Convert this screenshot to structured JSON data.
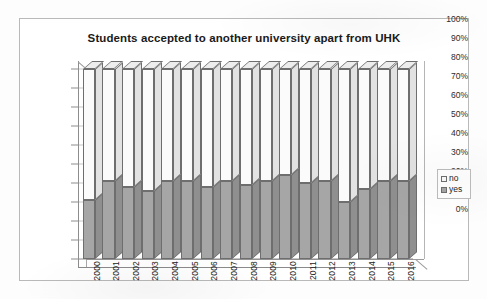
{
  "chart": {
    "title": "Students accepted to another university apart from UHK",
    "legend": {
      "items": [
        {
          "label": "no",
          "color": "#fbfbfb"
        },
        {
          "label": "yes",
          "color": "#a6a6a6"
        }
      ]
    }
  },
  "chart_data": {
    "type": "bar",
    "stacked": true,
    "normalized_percent": true,
    "title": "Students accepted to another university apart from UHK",
    "xlabel": "",
    "ylabel": "",
    "ylim": [
      0,
      100
    ],
    "yticks": [
      "0%",
      "10%",
      "20%",
      "30%",
      "40%",
      "50%",
      "60%",
      "70%",
      "80%",
      "90%",
      "100%"
    ],
    "ytick_values": [
      0,
      10,
      20,
      30,
      40,
      50,
      60,
      70,
      80,
      90,
      100
    ],
    "grid": true,
    "legend_position": "right",
    "categories": [
      "2000",
      "2001",
      "2002",
      "2003",
      "2004",
      "2005",
      "2006",
      "2007",
      "2008",
      "2009",
      "2010",
      "2011",
      "2012",
      "2013",
      "2014",
      "2015",
      "2016"
    ],
    "series": [
      {
        "name": "yes",
        "color": "#a6a6a6",
        "values": [
          31,
          41,
          38,
          36,
          41,
          41,
          38,
          41,
          39,
          41,
          44,
          40,
          41,
          30,
          37,
          41,
          41
        ]
      },
      {
        "name": "no",
        "color": "#fbfbfb",
        "values": [
          69,
          59,
          62,
          64,
          59,
          59,
          62,
          59,
          61,
          59,
          56,
          60,
          59,
          70,
          63,
          59,
          59
        ]
      }
    ]
  }
}
